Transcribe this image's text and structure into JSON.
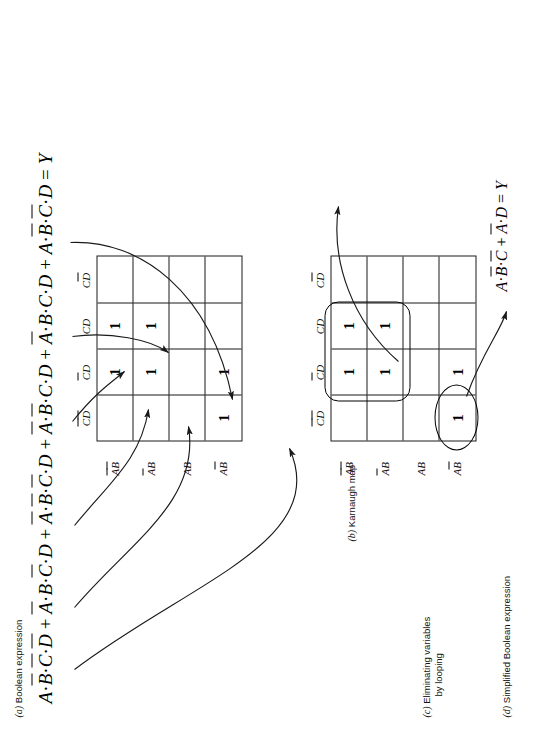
{
  "figure": {
    "title_hint": "Karnaugh map simplification figure",
    "panels": [
      {
        "label": "(a)",
        "caption": "Boolean expression"
      },
      {
        "label": "(b)",
        "caption": "Karnaugh map"
      },
      {
        "label": "(c)",
        "caption_line1": "Eliminating variables",
        "caption_line2": "by looping"
      },
      {
        "label": "(d)",
        "caption": "Simplified Boolean expression"
      }
    ]
  },
  "expression": {
    "terms": [
      {
        "vars": [
          {
            "s": "A",
            "bar": false
          },
          {
            "s": "B",
            "bar": true
          },
          {
            "s": "C",
            "bar": true
          },
          {
            "s": "D",
            "bar": true
          }
        ]
      },
      {
        "vars": [
          {
            "s": "A",
            "bar": true
          },
          {
            "s": "B",
            "bar": false
          },
          {
            "s": "C",
            "bar": true
          },
          {
            "s": "D",
            "bar": false
          }
        ]
      },
      {
        "vars": [
          {
            "s": "A",
            "bar": true
          },
          {
            "s": "B",
            "bar": true
          },
          {
            "s": "C",
            "bar": true
          },
          {
            "s": "D",
            "bar": false
          }
        ]
      },
      {
        "vars": [
          {
            "s": "A",
            "bar": true
          },
          {
            "s": "B",
            "bar": true
          },
          {
            "s": "C",
            "bar": false
          },
          {
            "s": "D",
            "bar": false
          }
        ]
      },
      {
        "vars": [
          {
            "s": "A",
            "bar": true
          },
          {
            "s": "B",
            "bar": false
          },
          {
            "s": "C",
            "bar": false
          },
          {
            "s": "D",
            "bar": false
          }
        ]
      },
      {
        "vars": [
          {
            "s": "A",
            "bar": false
          },
          {
            "s": "B",
            "bar": true
          },
          {
            "s": "C",
            "bar": true
          },
          {
            "s": "D",
            "bar": false
          }
        ]
      }
    ],
    "plus": "+",
    "equals": "=",
    "result": "Y",
    "dot": "·",
    "full_text": "A·B̅·C̅·D̅ + A̅·B·C̅·D + A̅·B̅·C̅·D + A̅·B̅·C·D + A̅·B·C·D + A·B̅·C̅·D = Y"
  },
  "simplified": {
    "terms": [
      {
        "vars": [
          {
            "s": "A",
            "bar": false
          },
          {
            "s": "B",
            "bar": true
          },
          {
            "s": "C",
            "bar": true
          }
        ]
      },
      {
        "vars": [
          {
            "s": "A",
            "bar": true
          },
          {
            "s": "D",
            "bar": false
          }
        ]
      }
    ],
    "plus": "+",
    "equals": "=",
    "result": "Y",
    "dot": "·",
    "full_text": "A·B̅·C̅ + A̅·D = Y"
  },
  "kmap": {
    "column_headers": [
      [
        {
          "s": "C",
          "bar": true
        },
        {
          "s": "D",
          "bar": true
        }
      ],
      [
        {
          "s": "C",
          "bar": true
        },
        {
          "s": "D",
          "bar": false
        }
      ],
      [
        {
          "s": "C",
          "bar": false
        },
        {
          "s": "D",
          "bar": false
        }
      ],
      [
        {
          "s": "C",
          "bar": false
        },
        {
          "s": "D",
          "bar": true
        }
      ]
    ],
    "column_headers_text": [
      "C̅D̅",
      "C̅D",
      "CD",
      "CD̅"
    ],
    "row_headers": [
      [
        {
          "s": "A",
          "bar": true
        },
        {
          "s": "B",
          "bar": true
        }
      ],
      [
        {
          "s": "A",
          "bar": true
        },
        {
          "s": "B",
          "bar": false
        }
      ],
      [
        {
          "s": "A",
          "bar": false
        },
        {
          "s": "B",
          "bar": false
        }
      ],
      [
        {
          "s": "A",
          "bar": false
        },
        {
          "s": "B",
          "bar": true
        }
      ]
    ],
    "row_headers_text": [
      "A̅B̅",
      "A̅B",
      "AB",
      "AB̅"
    ],
    "one": "1",
    "cells": [
      [
        "",
        "1",
        "1",
        ""
      ],
      [
        "",
        "1",
        "1",
        ""
      ],
      [
        "",
        "",
        "",
        ""
      ],
      [
        "1",
        "1",
        "",
        ""
      ]
    ]
  },
  "loops": [
    {
      "name": "quad-loop",
      "shape": "rounded-rect",
      "cells": "rows 1-2, columns 2-3"
    },
    {
      "name": "pair-loop",
      "shape": "ellipse",
      "cells": "row 4, columns 1-2"
    }
  ],
  "colors": {
    "ink": "#1a1a1a",
    "background": "#ffffff"
  }
}
